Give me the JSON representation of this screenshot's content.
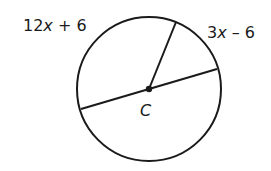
{
  "diagram": {
    "type": "circle-geometry",
    "center_label": "C",
    "arc_labels": {
      "left_arc": "12x + 6",
      "right_arc": "3x – 6"
    },
    "left_label_parts": {
      "coef": "12",
      "var": "x",
      "rest": " + 6"
    },
    "right_label_parts": {
      "coef": "3",
      "var": "x",
      "rest": " – 6"
    },
    "elements": [
      "circle",
      "diameter",
      "radius",
      "center point"
    ]
  }
}
